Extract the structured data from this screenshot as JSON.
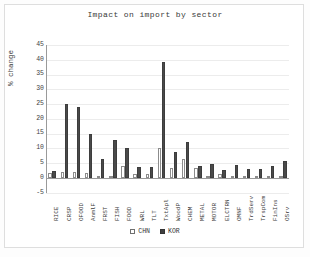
{
  "chart_data": {
    "type": "bar",
    "title": "Impact on import by sector",
    "xlabel": "",
    "ylabel": "% change",
    "ylim": [
      -5,
      45
    ],
    "yticks": [
      -5,
      0,
      5,
      10,
      15,
      20,
      25,
      30,
      35,
      40,
      45
    ],
    "grid": true,
    "legend_position": "bottom",
    "categories": [
      "RICE",
      "CRSP",
      "OFOOD",
      "AnmlF",
      "FRST",
      "FISH",
      "FOOD",
      "WRL",
      "TLT",
      "TxtApl",
      "WoodP",
      "CHEM",
      "METAL",
      "MOTOR",
      "ELCTRN",
      "OMNF",
      "TrdServ",
      "TrspCom",
      "FinIns",
      "OSrv"
    ],
    "series": [
      {
        "name": "CHN",
        "color": "#ffffff",
        "values": [
          1.8,
          2.2,
          2.0,
          1.8,
          0.7,
          0.7,
          4.2,
          1.5,
          1.2,
          10.3,
          3.4,
          6.4,
          3.5,
          0.4,
          1.4,
          0.2,
          0.2,
          0.2,
          0.2,
          0.3
        ]
      },
      {
        "name": "KOR",
        "color": "#4a4a4a",
        "values": [
          2.3,
          25.2,
          24.0,
          14.8,
          6.6,
          12.9,
          10.0,
          3.6,
          3.6,
          39.1,
          8.9,
          12.2,
          4.0,
          4.7,
          2.6,
          4.5,
          3.1,
          2.9,
          4.1,
          5.6
        ]
      }
    ]
  },
  "legend": {
    "items": [
      {
        "label": "CHN",
        "style": "hollow"
      },
      {
        "label": "KOR",
        "style": "filled"
      }
    ]
  }
}
